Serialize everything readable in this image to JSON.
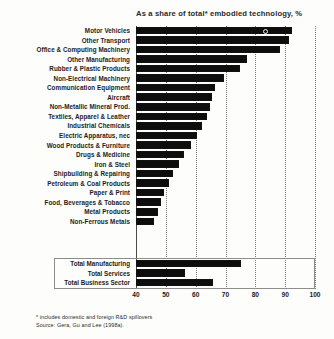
{
  "chart_data": {
    "type": "bar",
    "orientation": "horizontal",
    "title": "As a share of total* embodied technology, %",
    "xlabel": "",
    "ylabel": "",
    "xlim": [
      40,
      100
    ],
    "xticks": [
      40,
      50,
      60,
      70,
      80,
      90,
      100
    ],
    "grid": true,
    "legend": false,
    "bar_color": "#0d0d0d",
    "categories": [
      "Motor Vehicles",
      "Other Transport",
      "Office & Computing Machinery",
      "Other Manufacturing",
      "Rubber & Plastic Products",
      "Non-Electrical Machinery",
      "Communication Equipment",
      "Aircraft",
      "Non-Metallic Mineral Prod.",
      "Textiles, Apparel & Leather",
      "Industrial Chemicals",
      "Electric Apparatus, nec",
      "Wood Products & Furniture",
      "Drugs & Medicine",
      "Iron & Steel",
      "Shipbuilding & Repairing",
      "Petroleum & Coal Products",
      "Paper & Print",
      "Food, Beverages & Tobacco",
      "Metal Products",
      "Non-Ferrous Metals"
    ],
    "values": [
      92.3,
      91.2,
      88.3,
      77.3,
      74.8,
      69.5,
      66.5,
      65.6,
      64.7,
      63.8,
      62.2,
      60.5,
      58.3,
      56.0,
      54.5,
      52.5,
      51.0,
      49.5,
      48.5,
      47.5,
      46.0
    ],
    "totals_categories": [
      "Total Manufacturing",
      "Total Services",
      "Total Business Sector"
    ],
    "totals_values": [
      75.2,
      56.5,
      65.8
    ],
    "annotations": [
      {
        "category": "Motor Vehicles",
        "marker": "open-circle",
        "value": 83.0
      }
    ],
    "footnotes": [
      "* includes domestic and foreign R&D spillovers",
      "Source: Gera, Gu and Lee (1998a)."
    ]
  }
}
